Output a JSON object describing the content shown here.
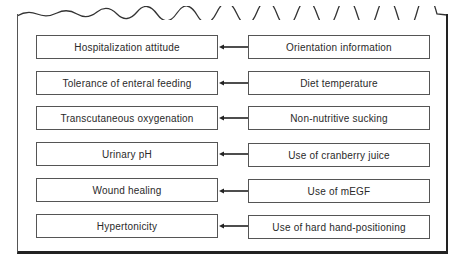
{
  "diagram": {
    "type": "cause-effect mapping",
    "arrow_direction": "right-to-left",
    "rows": [
      {
        "outcome": "Hospitalization attitude",
        "intervention": "Orientation information"
      },
      {
        "outcome": "Tolerance of enteral feeding",
        "intervention": "Diet temperature"
      },
      {
        "outcome": "Transcutaneous oxygenation",
        "intervention": "Non-nutritive sucking"
      },
      {
        "outcome": "Urinary pH",
        "intervention": "Use of cranberry juice"
      },
      {
        "outcome": "Wound healing",
        "intervention": "Use of mEGF"
      },
      {
        "outcome": "Hypertonicity",
        "intervention": "Use of hard hand-positioning"
      }
    ]
  },
  "colors": {
    "line": "#222222",
    "box_border": "#555555",
    "background": "#ffffff",
    "text": "#2a2a2a"
  }
}
